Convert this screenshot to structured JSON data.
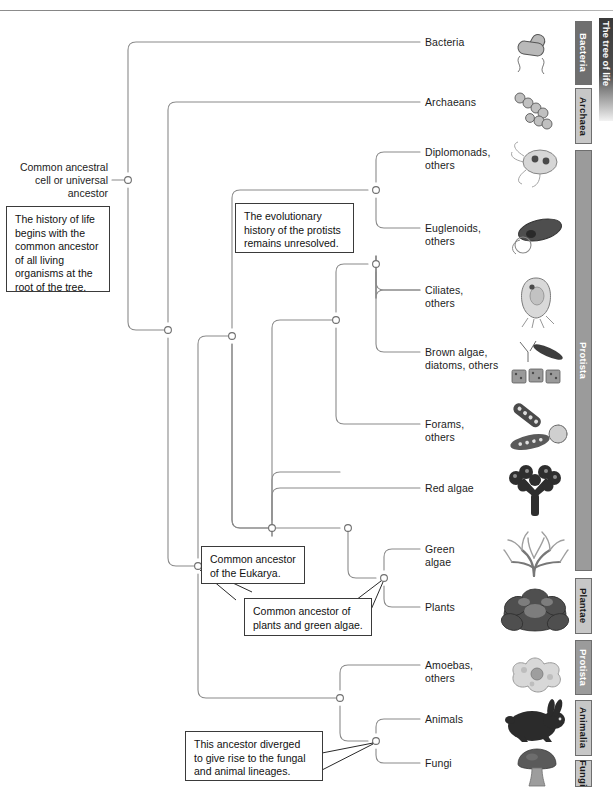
{
  "figure": {
    "edge_tab_label": "The tree of life",
    "root_label": "Common ancestral\ncell or universal\nancestor"
  },
  "leaves": [
    {
      "name": "bacteria",
      "label": "Bacteria",
      "y": 42,
      "icon": "bacterium-icon"
    },
    {
      "name": "archaeans",
      "label": "Archaeans",
      "y": 102,
      "icon": "archaean-chain-icon"
    },
    {
      "name": "diplomonads",
      "label": "Diplomonads,\nothers",
      "y": 152,
      "icon": "diplomonad-icon"
    },
    {
      "name": "euglenoids",
      "label": "Euglenoids,\nothers",
      "y": 228,
      "icon": "euglenoid-icon"
    },
    {
      "name": "ciliates",
      "label": "Ciliates,\nothers",
      "y": 290,
      "icon": "ciliate-icon"
    },
    {
      "name": "brown-algae",
      "label": "Brown algae,\ndiatoms, others",
      "y": 352,
      "icon": "diatom-icon"
    },
    {
      "name": "forams",
      "label": "Forams,\nothers",
      "y": 424,
      "icon": "foram-icon"
    },
    {
      "name": "red-algae",
      "label": "Red algae",
      "y": 488,
      "icon": "red-algae-icon"
    },
    {
      "name": "green-algae",
      "label": "Green\nalgae",
      "y": 549,
      "icon": "green-algae-icon"
    },
    {
      "name": "plants",
      "label": "Plants",
      "y": 607,
      "icon": "plant-icon"
    },
    {
      "name": "amoebas",
      "label": "Amoebas,\nothers",
      "y": 665,
      "icon": "amoeba-icon"
    },
    {
      "name": "animals",
      "label": "Animals",
      "y": 719,
      "icon": "rabbit-icon"
    },
    {
      "name": "fungi",
      "label": "Fungi",
      "y": 763,
      "icon": "mushroom-icon"
    }
  ],
  "notes": [
    {
      "name": "note-root",
      "text": "The history of life\nbegins with the\ncommon ancestor\nof all living\norganisms at the\nroot of the tree.",
      "x": 6,
      "y": 206,
      "w": 104,
      "h": 84
    },
    {
      "name": "note-protists",
      "text": "The evolutionary\nhistory of the protists\nremains unresolved.",
      "x": 235,
      "y": 203,
      "w": 119,
      "h": 49
    },
    {
      "name": "note-eukarya",
      "text": "Common ancestor\nof the Eukarya.",
      "x": 201,
      "y": 546,
      "w": 104,
      "h": 36
    },
    {
      "name": "note-plants-green-algae",
      "text": "Common ancestor of\nplants and green algae.",
      "x": 244,
      "y": 598,
      "w": 126,
      "h": 36
    },
    {
      "name": "note-fungi-animals",
      "text": "This ancestor diverged\nto give rise to the fungal\nand animal lineages.",
      "x": 185,
      "y": 731,
      "w": 136,
      "h": 49
    }
  ],
  "domain_bars": [
    {
      "name": "bar-bacteria",
      "label": "Bacteria",
      "style": "dark",
      "x": 575,
      "y": 21,
      "h": 64
    },
    {
      "name": "bar-archaea",
      "label": "Archaea",
      "style": "light",
      "x": 575,
      "y": 88,
      "h": 56
    },
    {
      "name": "bar-protista",
      "label": "Protista",
      "style": "plain",
      "x": 575,
      "y": 150,
      "h": 421
    },
    {
      "name": "bar-plantae",
      "label": "Plantae",
      "style": "light",
      "x": 575,
      "y": 578,
      "h": 56
    },
    {
      "name": "bar-protista2",
      "label": "Protista",
      "style": "plain",
      "x": 575,
      "y": 640,
      "h": 55
    },
    {
      "name": "bar-animalia",
      "label": "Animalia",
      "style": "light",
      "x": 575,
      "y": 700,
      "h": 56
    },
    {
      "name": "bar-fungi",
      "label": "Fungi",
      "style": "light",
      "x": 575,
      "y": 760,
      "h": 27
    }
  ],
  "colors": {
    "branch_line": "#8a8a8a",
    "node_outline": "#6f6f6f",
    "text": "#1c1c1c",
    "bar_dark": "#6f6f6f",
    "bar_light": "#c7c7c7",
    "bar_plain": "#9b9b9b"
  }
}
